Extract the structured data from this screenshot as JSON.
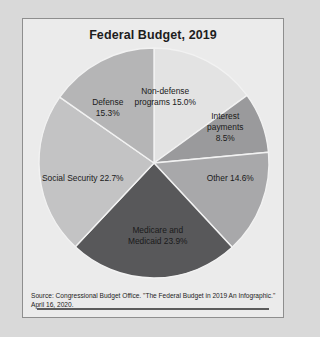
{
  "figure": {
    "title": "Federal Budget, 2019",
    "source_note": "Source: Congressional Budget Office. \"The Federal Budget in 2019 An Infographic.\" April 16, 2020."
  },
  "chart_data": {
    "type": "pie",
    "title": "Federal Budget, 2019",
    "xlabel": "",
    "ylabel": "",
    "units": "percent of total federal budget",
    "start_angle_deg": 0,
    "direction": "clockwise",
    "legend": "none (labels drawn on slices)",
    "categories": [
      "Non-defense programs",
      "Interest payments",
      "Other",
      "Medicare and Medicaid",
      "Social Security",
      "Defense"
    ],
    "values": [
      15.0,
      8.5,
      14.6,
      23.9,
      22.7,
      15.3
    ],
    "total": 100.0,
    "slices": [
      {
        "name": "Non-defense programs",
        "value": 15.0,
        "label": "Non-defense\nprograms 15.0%",
        "color": "#e3e3e3",
        "label_x": 0.545,
        "label_y": 0.215
      },
      {
        "name": "Interest payments",
        "value": 8.5,
        "label": "Interest\npayments\n8.5%",
        "color": "#9a9a9c",
        "label_x": 0.785,
        "label_y": 0.345
      },
      {
        "name": "Other",
        "value": 14.6,
        "label": "Other 14.6%",
        "color": "#a8a8aa",
        "label_x": 0.805,
        "label_y": 0.565
      },
      {
        "name": "Medicare and Medicaid",
        "value": 23.9,
        "label": "Medicare and\nMedicaid 23.9%",
        "color": "#58585a",
        "label_x": 0.515,
        "label_y": 0.815
      },
      {
        "name": "Social Security",
        "value": 22.7,
        "label": "Social Security 22.7%",
        "color": "#c3c3c4",
        "label_x": 0.215,
        "label_y": 0.565
      },
      {
        "name": "Defense",
        "value": 15.3,
        "label": "Defense\n15.3%",
        "color": "#b5b5b6",
        "label_x": 0.315,
        "label_y": 0.265
      }
    ]
  }
}
